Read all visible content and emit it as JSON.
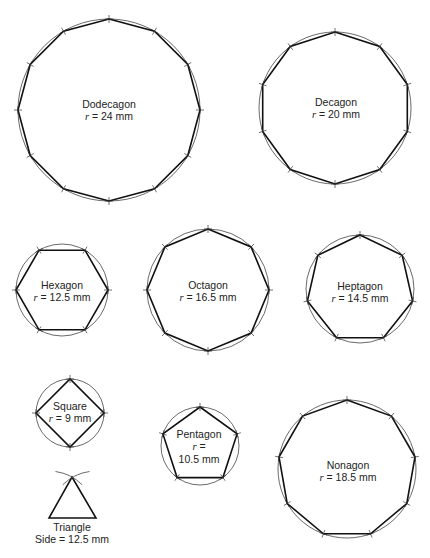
{
  "diagram": {
    "type": "geometric-construction",
    "shapes": [
      {
        "id": "dodecagon",
        "name": "Dodecagon",
        "measure_prefix": "r",
        "measure_value": "24 mm",
        "sides": 12,
        "cx": 109,
        "cy": 110,
        "r": 91,
        "rot": -90
      },
      {
        "id": "decagon",
        "name": "Decagon",
        "measure_prefix": "r",
        "measure_value": "20 mm",
        "sides": 10,
        "cx": 335,
        "cy": 108,
        "r": 76,
        "rot": -90
      },
      {
        "id": "hexagon",
        "name": "Hexagon",
        "measure_prefix": "r",
        "measure_value": "12.5 mm",
        "sides": 6,
        "cx": 62,
        "cy": 290,
        "r": 46,
        "rot": 0
      },
      {
        "id": "octagon",
        "name": "Octagon",
        "measure_prefix": "r",
        "measure_value": "16.5 mm",
        "sides": 8,
        "cx": 208,
        "cy": 290,
        "r": 61,
        "rot": -90
      },
      {
        "id": "heptagon",
        "name": "Heptagon",
        "measure_prefix": "r",
        "measure_value": "14.5 mm",
        "sides": 7,
        "cx": 360,
        "cy": 289,
        "r": 54,
        "rot": -90
      },
      {
        "id": "square",
        "name": "Square",
        "measure_prefix": "r",
        "measure_value": "9 mm",
        "sides": 4,
        "cx": 70,
        "cy": 413,
        "r": 34,
        "rot": 0
      },
      {
        "id": "pentagon",
        "name": "Pentagon",
        "measure_prefix": "r",
        "measure_value": "10.5 mm",
        "sides": 5,
        "cx": 200,
        "cy": 446,
        "r": 39,
        "rot": -90,
        "wrap": true
      },
      {
        "id": "nonagon",
        "name": "Nonagon",
        "measure_prefix": "r",
        "measure_value": "18.5 mm",
        "sides": 9,
        "cx": 347,
        "cy": 469,
        "r": 69,
        "rot": -90
      }
    ],
    "triangle": {
      "name": "Triangle",
      "measure_prefix": "Side",
      "measure_value": "12.5 mm",
      "apex": [
        72,
        477
      ],
      "base_left": [
        49,
        518
      ],
      "base_right": [
        96,
        518
      ]
    }
  },
  "labels": {
    "dodecagon_name": "Dodecagon",
    "dodecagon_r": "r",
    "dodecagon_val": "=  24 mm",
    "decagon_name": "Decagon",
    "decagon_r": "r",
    "decagon_val": "=  20 mm",
    "hexagon_name": "Hexagon",
    "hexagon_r": "r",
    "hexagon_val": "=  12.5 mm",
    "octagon_name": "Octagon",
    "octagon_r": "r",
    "octagon_val": "=  16.5 mm",
    "heptagon_name": "Heptagon",
    "heptagon_r": "r",
    "heptagon_val": "=  14.5 mm",
    "square_name": "Square",
    "square_r": "r",
    "square_val": "=  9 mm",
    "pentagon_name": "Pentagon",
    "pentagon_r": "r",
    "pentagon_eq": "=",
    "pentagon_val": "10.5 mm",
    "nonagon_name": "Nonagon",
    "nonagon_r": "r",
    "nonagon_val": "=  18.5 mm",
    "triangle_name": "Triangle",
    "triangle_side": "Side  =  12.5 mm"
  }
}
